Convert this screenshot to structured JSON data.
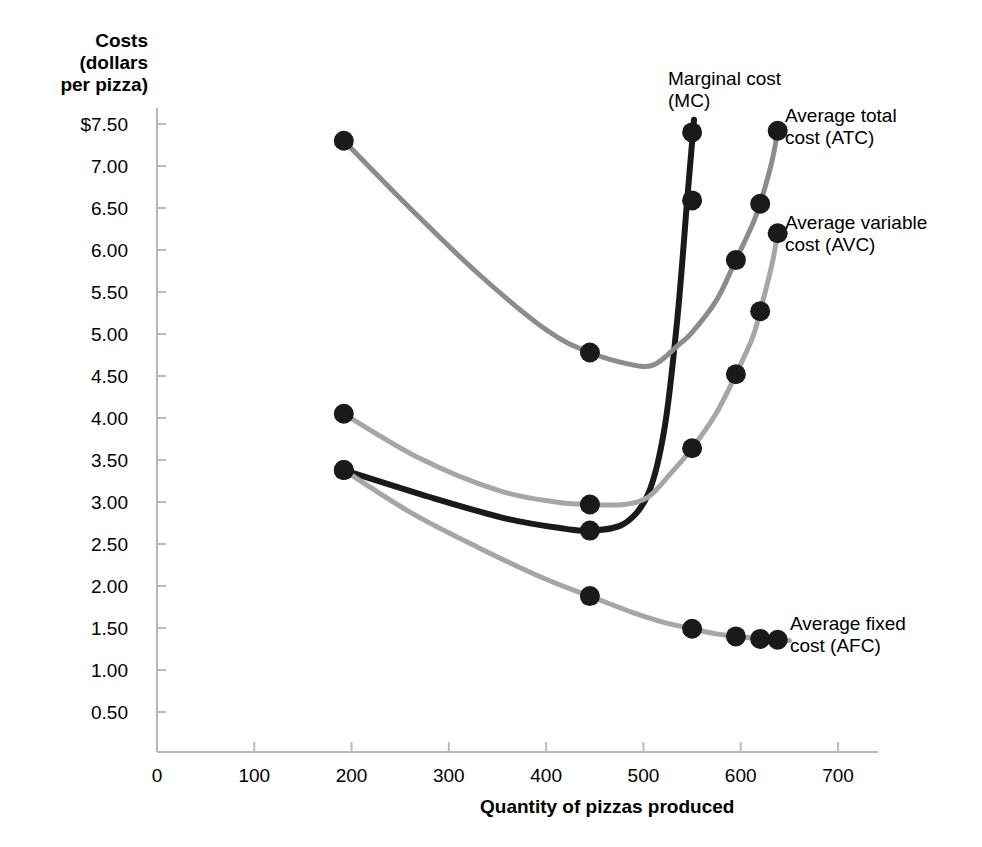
{
  "axes": {
    "y_title": "Costs\n(dollars\nper pizza)",
    "x_title": "Quantity of pizzas produced",
    "y_ticks": [
      "$7.50",
      "7.00",
      "6.50",
      "6.00",
      "5.50",
      "5.00",
      "4.50",
      "4.00",
      "3.50",
      "3.00",
      "2.50",
      "2.00",
      "1.50",
      "1.00",
      "0.50"
    ],
    "x_ticks": [
      "0",
      "100",
      "200",
      "300",
      "400",
      "500",
      "600",
      "700"
    ]
  },
  "labels": {
    "mc": "Marginal cost\n(MC)",
    "atc": "Average total\ncost (ATC)",
    "avc": "Average variable\ncost (AVC)",
    "afc": "Average fixed\ncost (AFC)"
  },
  "chart_data": {
    "type": "line",
    "title": "",
    "xlabel": "Quantity of pizzas produced",
    "ylabel": "Costs (dollars per pizza)",
    "xlim": [
      0,
      730
    ],
    "ylim": [
      0,
      7.75
    ],
    "grid": false,
    "legend": "inline-curve-labels",
    "y_tick_values": [
      7.5,
      7.0,
      6.5,
      6.0,
      5.5,
      5.0,
      4.5,
      4.0,
      3.5,
      3.0,
      2.5,
      2.0,
      1.5,
      1.0,
      0.5
    ],
    "x_tick_values": [
      0,
      100,
      200,
      300,
      400,
      500,
      600,
      700
    ],
    "series": [
      {
        "name": "Marginal cost (MC)",
        "abbr": "MC",
        "color": "#1a1a1a",
        "width": 6,
        "points": [
          {
            "x": 192,
            "y": 3.38
          },
          {
            "x": 445,
            "y": 2.66
          },
          {
            "x": 550,
            "y": 7.4
          }
        ],
        "path": [
          {
            "x": 192,
            "y": 3.38
          },
          {
            "x": 280,
            "y": 3.06
          },
          {
            "x": 360,
            "y": 2.8
          },
          {
            "x": 420,
            "y": 2.68
          },
          {
            "x": 445,
            "y": 2.66
          },
          {
            "x": 480,
            "y": 2.74
          },
          {
            "x": 505,
            "y": 3.1
          },
          {
            "x": 522,
            "y": 3.9
          },
          {
            "x": 535,
            "y": 5.2
          },
          {
            "x": 545,
            "y": 6.6
          },
          {
            "x": 552,
            "y": 7.55
          }
        ]
      },
      {
        "name": "Average total cost (ATC)",
        "abbr": "ATC",
        "color": "#8c8c8c",
        "width": 5,
        "points": [
          {
            "x": 192,
            "y": 7.3
          },
          {
            "x": 445,
            "y": 4.78
          },
          {
            "x": 550,
            "y": 6.59
          },
          {
            "x": 595,
            "y": 5.88
          },
          {
            "x": 620,
            "y": 6.55
          },
          {
            "x": 638,
            "y": 7.42
          }
        ],
        "path": [
          {
            "x": 192,
            "y": 7.3
          },
          {
            "x": 260,
            "y": 6.5
          },
          {
            "x": 330,
            "y": 5.72
          },
          {
            "x": 400,
            "y": 5.05
          },
          {
            "x": 445,
            "y": 4.78
          },
          {
            "x": 490,
            "y": 4.63
          },
          {
            "x": 512,
            "y": 4.64
          },
          {
            "x": 535,
            "y": 4.86
          },
          {
            "x": 550,
            "y": 5.02
          },
          {
            "x": 575,
            "y": 5.4
          },
          {
            "x": 595,
            "y": 5.88
          },
          {
            "x": 612,
            "y": 6.3
          },
          {
            "x": 620,
            "y": 6.55
          },
          {
            "x": 632,
            "y": 7.05
          },
          {
            "x": 638,
            "y": 7.42
          }
        ]
      },
      {
        "name": "Average variable cost (AVC)",
        "abbr": "AVC",
        "color": "#a6a6a6",
        "width": 5,
        "points": [
          {
            "x": 192,
            "y": 4.05
          },
          {
            "x": 445,
            "y": 2.97
          },
          {
            "x": 550,
            "y": 3.64
          },
          {
            "x": 595,
            "y": 4.52
          },
          {
            "x": 620,
            "y": 5.27
          },
          {
            "x": 638,
            "y": 6.2
          }
        ],
        "path": [
          {
            "x": 192,
            "y": 4.05
          },
          {
            "x": 270,
            "y": 3.52
          },
          {
            "x": 350,
            "y": 3.14
          },
          {
            "x": 410,
            "y": 3.0
          },
          {
            "x": 445,
            "y": 2.97
          },
          {
            "x": 480,
            "y": 2.97
          },
          {
            "x": 505,
            "y": 3.06
          },
          {
            "x": 528,
            "y": 3.34
          },
          {
            "x": 550,
            "y": 3.64
          },
          {
            "x": 575,
            "y": 4.06
          },
          {
            "x": 595,
            "y": 4.52
          },
          {
            "x": 612,
            "y": 4.95
          },
          {
            "x": 620,
            "y": 5.27
          },
          {
            "x": 632,
            "y": 5.82
          },
          {
            "x": 638,
            "y": 6.2
          }
        ]
      },
      {
        "name": "Average fixed cost (AFC)",
        "abbr": "AFC",
        "color": "#a6a6a6",
        "width": 5,
        "points": [
          {
            "x": 192,
            "y": 3.38
          },
          {
            "x": 445,
            "y": 1.88
          },
          {
            "x": 550,
            "y": 1.49
          },
          {
            "x": 595,
            "y": 1.4
          },
          {
            "x": 620,
            "y": 1.37
          },
          {
            "x": 638,
            "y": 1.36
          }
        ],
        "path": [
          {
            "x": 192,
            "y": 3.38
          },
          {
            "x": 260,
            "y": 2.88
          },
          {
            "x": 330,
            "y": 2.46
          },
          {
            "x": 400,
            "y": 2.08
          },
          {
            "x": 445,
            "y": 1.88
          },
          {
            "x": 490,
            "y": 1.68
          },
          {
            "x": 520,
            "y": 1.57
          },
          {
            "x": 550,
            "y": 1.49
          },
          {
            "x": 575,
            "y": 1.43
          },
          {
            "x": 595,
            "y": 1.4
          },
          {
            "x": 620,
            "y": 1.37
          },
          {
            "x": 638,
            "y": 1.36
          },
          {
            "x": 650,
            "y": 1.35
          }
        ]
      }
    ]
  }
}
